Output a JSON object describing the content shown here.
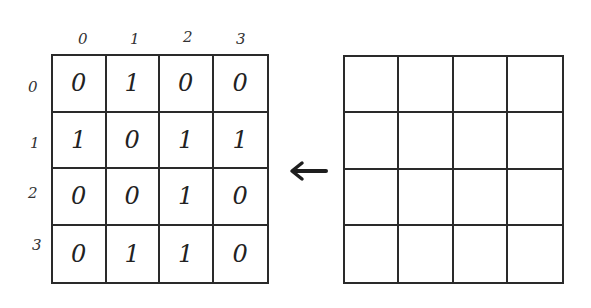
{
  "left_matrix": {
    "column_labels": [
      "0",
      "1",
      "2",
      "3"
    ],
    "row_labels": [
      "0",
      "1",
      "2",
      "3"
    ],
    "cells": [
      [
        "0",
        "1",
        "0",
        "0"
      ],
      [
        "1",
        "0",
        "1",
        "1"
      ],
      [
        "0",
        "0",
        "1",
        "0"
      ],
      [
        "0",
        "1",
        "1",
        "0"
      ]
    ]
  },
  "right_grid": {
    "rows": 4,
    "cols": 4,
    "cells": [
      [
        "",
        "",
        "",
        ""
      ],
      [
        "",
        "",
        "",
        ""
      ],
      [
        "",
        "",
        "",
        ""
      ],
      [
        "",
        "",
        "",
        ""
      ]
    ]
  },
  "arrow": {
    "icon": "left-arrow-icon",
    "direction": "left"
  },
  "colors": {
    "ink": "#2a2a2a",
    "background": "#ffffff"
  }
}
